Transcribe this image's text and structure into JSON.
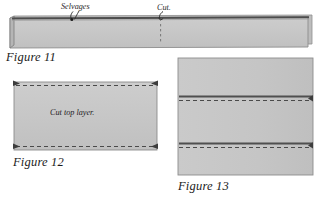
{
  "document": {
    "type": "sewing-instruction-diagram",
    "figure_count": 3
  },
  "colors": {
    "fabric_fill": "#c7c7c7",
    "fabric_fill_light": "#cfcfcf",
    "fabric_edge_dark": "#5a5a5a",
    "outline": "#8a8a8a",
    "dashed_line": "#4a4a4a",
    "text": "#1b1b1b",
    "background": "#ffffff"
  },
  "figures": [
    {
      "id": "figure-11",
      "caption": "Figure 11",
      "description": "Long horizontal folded fabric strip with selvage edge along the top and a cut mark near the middle.",
      "annotations": [
        {
          "name": "selvages-label",
          "text": "Selvages",
          "pointer": "curved-arrow-down"
        },
        {
          "name": "cut-label",
          "text": "Cut.",
          "pointer": "curved-arrow-down"
        }
      ]
    },
    {
      "id": "figure-12",
      "caption": "Figure 12",
      "description": "Wide rectangle of fabric with dashed stitch lines along top and bottom edges and pin markers at the corners.",
      "inner_labels": [
        {
          "name": "cut-top-layer-label",
          "text": "Cut top layer."
        }
      ]
    },
    {
      "id": "figure-13",
      "caption": "Figure 13",
      "description": "Tall rectangle of fabric with two horizontal seam bands, each with a dashed stitching line below it.",
      "inner_labels": []
    }
  ]
}
